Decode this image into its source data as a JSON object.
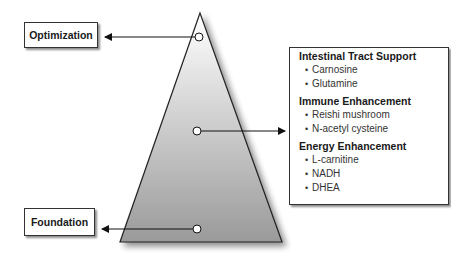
{
  "diagram": {
    "levels": {
      "top": {
        "label": "Optimization"
      },
      "bottom": {
        "label": "Foundation"
      }
    },
    "details": {
      "sections": [
        {
          "title": "Intestinal Tract Support",
          "items": [
            "Carnosine",
            "Glutamine"
          ]
        },
        {
          "title": "Immune Enhancement",
          "items": [
            "Reishi mushroom",
            "N-acetyl cysteine"
          ]
        },
        {
          "title": "Energy Enhancement",
          "items": [
            "L-carnitine",
            "NADH",
            "DHEA"
          ]
        }
      ],
      "bullet": "•"
    },
    "colors": {
      "stroke": "#222222",
      "gradient_top": "#ffffff",
      "gradient_bottom": "#9a9a9a"
    }
  }
}
